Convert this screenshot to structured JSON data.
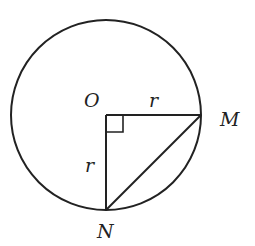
{
  "diagram": {
    "type": "geometry",
    "circle": {
      "center_label": "O",
      "cx": 106,
      "cy": 115,
      "r": 95
    },
    "points": {
      "O": {
        "label": "O",
        "x": 106,
        "y": 115
      },
      "M": {
        "label": "M",
        "x": 201,
        "y": 115
      },
      "N": {
        "label": "N",
        "x": 106,
        "y": 210
      }
    },
    "segments": [
      {
        "from": "O",
        "to": "M",
        "label": "r"
      },
      {
        "from": "O",
        "to": "N",
        "label": "r"
      },
      {
        "from": "M",
        "to": "N",
        "label": ""
      }
    ],
    "right_angle_at": "O",
    "labels": {
      "O": "O",
      "M": "M",
      "N": "N",
      "r_horizontal": "r",
      "r_vertical": "r"
    },
    "colors": {
      "stroke": "#222222",
      "background": "#ffffff"
    }
  }
}
